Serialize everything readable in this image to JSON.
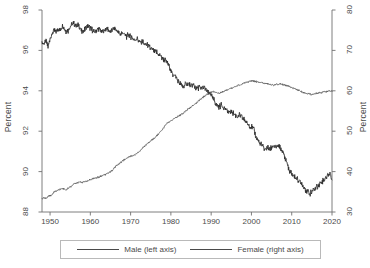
{
  "chart_data": {
    "type": "line",
    "title": "",
    "xlabel": "",
    "ylabel": "Percent",
    "ylabel_right": "Percent",
    "xlim": [
      1948,
      2020
    ],
    "ylim": [
      88,
      98
    ],
    "ylim_right": [
      30,
      80
    ],
    "grid": false,
    "legend_position": "bottom-center",
    "xticks": [
      1950,
      1960,
      1970,
      1980,
      1990,
      2000,
      2010,
      2020
    ],
    "xtick_labels": [
      "1950",
      "1960",
      "1970",
      "1980",
      "1990",
      "2000",
      "2010",
      "2020"
    ],
    "yticks_left": [
      88,
      90,
      92,
      94,
      96,
      98
    ],
    "ytick_labels_left": [
      "88",
      "90",
      "92",
      "94",
      "96",
      "98"
    ],
    "yticks_right": [
      30,
      40,
      50,
      60,
      70,
      80
    ],
    "ytick_labels_right": [
      "30",
      "40",
      "50",
      "60",
      "70",
      "80"
    ],
    "line_color": "#2b2b2b",
    "series": [
      {
        "name": "Male (left axis)",
        "axis": "left",
        "color": "#2b2b2b",
        "x": [
          1948.0,
          1948.5,
          1949.0,
          1949.5,
          1950.0,
          1950.5,
          1951.0,
          1951.5,
          1952.0,
          1952.5,
          1953.0,
          1953.5,
          1954.0,
          1954.5,
          1955.0,
          1955.5,
          1956.0,
          1956.5,
          1957.0,
          1957.5,
          1958.0,
          1958.5,
          1959.0,
          1959.5,
          1960.0,
          1960.5,
          1961.0,
          1961.5,
          1962.0,
          1962.5,
          1963.0,
          1963.5,
          1964.0,
          1964.5,
          1965.0,
          1965.5,
          1966.0,
          1966.5,
          1967.0,
          1967.5,
          1968.0,
          1968.5,
          1969.0,
          1969.5,
          1970.0,
          1970.5,
          1971.0,
          1971.5,
          1972.0,
          1972.5,
          1973.0,
          1973.5,
          1974.0,
          1974.5,
          1975.0,
          1975.5,
          1976.0,
          1976.5,
          1977.0,
          1977.5,
          1978.0,
          1978.5,
          1979.0,
          1979.5,
          1980.0,
          1980.5,
          1981.0,
          1981.5,
          1982.0,
          1982.5,
          1983.0,
          1983.5,
          1984.0,
          1984.5,
          1985.0,
          1985.5,
          1986.0,
          1986.5,
          1987.0,
          1987.5,
          1988.0,
          1988.5,
          1989.0,
          1989.5,
          1990.0,
          1990.5,
          1991.0,
          1991.5,
          1992.0,
          1992.5,
          1993.0,
          1993.5,
          1994.0,
          1994.5,
          1995.0,
          1995.5,
          1996.0,
          1996.5,
          1997.0,
          1997.5,
          1998.0,
          1998.5,
          1999.0,
          1999.5,
          2000.0,
          2000.5,
          2001.0,
          2001.5,
          2002.0,
          2002.5,
          2003.0,
          2003.5,
          2004.0,
          2004.5,
          2005.0,
          2005.5,
          2006.0,
          2006.5,
          2007.0,
          2007.5,
          2008.0,
          2008.5,
          2009.0,
          2009.5,
          2010.0,
          2010.5,
          2011.0,
          2011.5,
          2012.0,
          2012.5,
          2013.0,
          2013.5,
          2014.0,
          2014.5,
          2015.0,
          2015.5,
          2016.0,
          2016.5,
          2017.0,
          2017.5,
          2018.0,
          2018.5,
          2019.0,
          2019.5,
          2020.0
        ],
        "y": [
          96.4,
          96.3,
          96.5,
          96.2,
          96.6,
          96.8,
          97.0,
          96.9,
          97.1,
          97.0,
          97.2,
          97.1,
          96.9,
          97.0,
          97.2,
          97.3,
          97.3,
          97.2,
          97.3,
          97.1,
          96.9,
          97.0,
          97.1,
          97.2,
          97.1,
          97.0,
          96.9,
          97.0,
          97.1,
          97.0,
          96.9,
          97.0,
          97.1,
          97.0,
          96.9,
          97.0,
          97.1,
          97.0,
          96.9,
          96.8,
          96.9,
          96.8,
          96.7,
          96.8,
          96.7,
          96.6,
          96.5,
          96.6,
          96.5,
          96.4,
          96.4,
          96.3,
          96.3,
          96.2,
          96.1,
          96.0,
          95.9,
          95.9,
          95.8,
          95.7,
          95.6,
          95.5,
          95.4,
          95.3,
          95.0,
          94.8,
          94.8,
          94.6,
          94.4,
          94.3,
          94.2,
          94.3,
          94.4,
          94.3,
          94.2,
          94.3,
          94.2,
          94.1,
          94.2,
          94.1,
          94.2,
          94.1,
          94.0,
          93.9,
          93.8,
          93.6,
          93.4,
          93.3,
          93.2,
          93.3,
          93.2,
          93.1,
          93.0,
          92.9,
          93.0,
          92.9,
          92.8,
          92.7,
          92.8,
          92.7,
          92.6,
          92.5,
          92.4,
          92.3,
          92.2,
          92.1,
          91.8,
          91.6,
          91.4,
          91.3,
          91.2,
          91.1,
          91.2,
          91.1,
          91.2,
          91.3,
          91.2,
          91.3,
          91.2,
          91.1,
          90.9,
          90.6,
          90.3,
          90.0,
          89.9,
          89.8,
          89.7,
          89.6,
          89.5,
          89.4,
          89.2,
          89.1,
          89.0,
          88.9,
          89.0,
          89.1,
          89.2,
          89.3,
          89.4,
          89.5,
          89.6,
          89.7,
          89.8,
          89.9,
          89.6
        ]
      },
      {
        "name": "Female (right axis)",
        "axis": "right",
        "color": "#4a4a4a",
        "x": [
          1948.0,
          1948.5,
          1949.0,
          1949.5,
          1950.0,
          1950.5,
          1951.0,
          1951.5,
          1952.0,
          1952.5,
          1953.0,
          1953.5,
          1954.0,
          1954.5,
          1955.0,
          1955.5,
          1956.0,
          1956.5,
          1957.0,
          1957.5,
          1958.0,
          1958.5,
          1959.0,
          1959.5,
          1960.0,
          1960.5,
          1961.0,
          1961.5,
          1962.0,
          1962.5,
          1963.0,
          1963.5,
          1964.0,
          1964.5,
          1965.0,
          1965.5,
          1966.0,
          1966.5,
          1967.0,
          1967.5,
          1968.0,
          1968.5,
          1969.0,
          1969.5,
          1970.0,
          1970.5,
          1971.0,
          1971.5,
          1972.0,
          1972.5,
          1973.0,
          1973.5,
          1974.0,
          1974.5,
          1975.0,
          1975.5,
          1976.0,
          1976.5,
          1977.0,
          1977.5,
          1978.0,
          1978.5,
          1979.0,
          1979.5,
          1980.0,
          1980.5,
          1981.0,
          1981.5,
          1982.0,
          1982.5,
          1983.0,
          1983.5,
          1984.0,
          1984.5,
          1985.0,
          1985.5,
          1986.0,
          1986.5,
          1987.0,
          1987.5,
          1988.0,
          1988.5,
          1989.0,
          1989.5,
          1990.0,
          1990.5,
          1991.0,
          1991.5,
          1992.0,
          1992.5,
          1993.0,
          1993.5,
          1994.0,
          1994.5,
          1995.0,
          1995.5,
          1996.0,
          1996.5,
          1997.0,
          1997.5,
          1998.0,
          1998.5,
          1999.0,
          1999.5,
          2000.0,
          2000.5,
          2001.0,
          2001.5,
          2002.0,
          2002.5,
          2003.0,
          2003.5,
          2004.0,
          2004.5,
          2005.0,
          2005.5,
          2006.0,
          2006.5,
          2007.0,
          2007.5,
          2008.0,
          2008.5,
          2009.0,
          2009.5,
          2010.0,
          2010.5,
          2011.0,
          2011.5,
          2012.0,
          2012.5,
          2013.0,
          2013.5,
          2014.0,
          2014.5,
          2015.0,
          2015.5,
          2016.0,
          2016.5,
          2017.0,
          2017.5,
          2018.0,
          2018.5,
          2019.0,
          2019.5,
          2020.0
        ],
        "y": [
          33.2,
          33.5,
          33.4,
          33.8,
          34.0,
          34.3,
          35.0,
          35.2,
          35.4,
          35.6,
          35.8,
          35.7,
          35.5,
          35.9,
          36.2,
          36.5,
          37.0,
          37.2,
          37.3,
          37.4,
          37.3,
          37.5,
          37.6,
          37.8,
          38.0,
          38.2,
          38.4,
          38.5,
          38.6,
          38.8,
          39.0,
          39.2,
          39.4,
          39.6,
          40.0,
          40.4,
          41.0,
          41.4,
          41.8,
          42.2,
          42.6,
          43.0,
          43.4,
          43.6,
          43.8,
          44.0,
          44.2,
          44.5,
          44.8,
          45.3,
          45.8,
          46.3,
          46.8,
          47.2,
          47.6,
          48.0,
          48.4,
          48.9,
          49.4,
          50.0,
          50.6,
          51.2,
          51.8,
          52.3,
          52.6,
          52.9,
          53.2,
          53.5,
          53.8,
          54.1,
          54.4,
          54.8,
          55.2,
          55.6,
          56.0,
          56.4,
          56.8,
          57.2,
          57.6,
          58.0,
          58.4,
          58.8,
          59.2,
          59.4,
          59.6,
          59.8,
          59.6,
          59.5,
          59.4,
          59.6,
          59.8,
          60.0,
          60.2,
          60.4,
          60.6,
          60.8,
          61.0,
          61.2,
          61.4,
          61.6,
          61.8,
          62.0,
          62.2,
          62.4,
          62.5,
          62.4,
          62.3,
          62.2,
          62.1,
          62.0,
          61.9,
          61.8,
          61.7,
          61.6,
          61.5,
          61.4,
          61.5,
          61.6,
          61.7,
          61.6,
          61.5,
          61.4,
          61.2,
          61.0,
          60.8,
          60.6,
          60.4,
          60.2,
          60.0,
          59.8,
          59.6,
          59.4,
          59.3,
          59.2,
          59.1,
          59.2,
          59.3,
          59.4,
          59.5,
          59.6,
          59.7,
          59.8,
          59.9,
          60.0,
          59.8
        ]
      }
    ]
  },
  "legend": {
    "entries": [
      {
        "label": "Male (left axis)"
      },
      {
        "label": "Female (right axis)"
      }
    ]
  }
}
